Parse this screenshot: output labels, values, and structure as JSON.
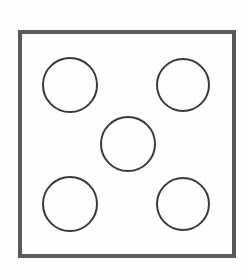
{
  "figure": {
    "background_color": "#fefefe",
    "canvas": {
      "width": 251,
      "height": 276
    }
  },
  "square": {
    "label": "outer-square",
    "x": 18,
    "y": 30,
    "width": 218,
    "height": 228,
    "stroke_color": "#5a5a5a",
    "stroke_width": 4,
    "fill": "none"
  },
  "circles": [
    {
      "label": "top-left-circle",
      "cx": 70,
      "cy": 85,
      "r": 27,
      "stroke_color": "#3a3a3a",
      "stroke_width": 2,
      "fill": "none"
    },
    {
      "label": "top-right-circle",
      "cx": 183,
      "cy": 85,
      "r": 26,
      "stroke_color": "#3a3a3a",
      "stroke_width": 2,
      "fill": "none"
    },
    {
      "label": "center-circle",
      "cx": 128,
      "cy": 144,
      "r": 27,
      "stroke_color": "#3a3a3a",
      "stroke_width": 2,
      "fill": "none"
    },
    {
      "label": "bottom-left-circle",
      "cx": 70,
      "cy": 204,
      "r": 27,
      "stroke_color": "#3a3a3a",
      "stroke_width": 2,
      "fill": "none"
    },
    {
      "label": "bottom-right-circle",
      "cx": 183,
      "cy": 204,
      "r": 26,
      "stroke_color": "#3a3a3a",
      "stroke_width": 2,
      "fill": "none"
    }
  ],
  "counts": {
    "circle_count": 5,
    "square_count": 1
  }
}
